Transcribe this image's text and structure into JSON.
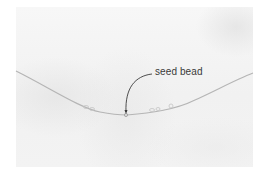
{
  "figure": {
    "label": "seed bead",
    "colors": {
      "background": "#ffffff",
      "photo": "#f3f3f3",
      "wire": "#b8b8b8",
      "leader_line": "#3a3a3a"
    }
  }
}
